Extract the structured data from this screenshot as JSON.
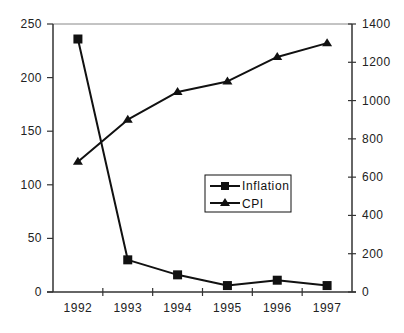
{
  "chart_data": {
    "type": "line",
    "title": "",
    "xlabel": "",
    "ylabel": "",
    "y2label": "",
    "categories": [
      "1992",
      "1993",
      "1994",
      "1995",
      "1996",
      "1997"
    ],
    "series": [
      {
        "name": "Inflation",
        "axis": "left",
        "marker": "square",
        "values": [
          236,
          30,
          16,
          6,
          11,
          6
        ]
      },
      {
        "name": "CPI",
        "axis": "right",
        "marker": "triangle",
        "values": [
          680,
          900,
          1045,
          1100,
          1228,
          1300
        ]
      }
    ],
    "y_left": {
      "min": 0,
      "max": 250,
      "ticks": [
        0,
        50,
        100,
        150,
        200,
        250
      ]
    },
    "y_right": {
      "min": 0,
      "max": 1400,
      "ticks": [
        0,
        200,
        400,
        600,
        800,
        1000,
        1200,
        1400
      ]
    },
    "grid": false,
    "legend": {
      "position": "inside-center-right",
      "entries": [
        "Inflation",
        "CPI"
      ]
    }
  },
  "colors": {
    "line": "#111111",
    "axis": "#333333",
    "frame_top": "#888888",
    "background": "#ffffff"
  }
}
